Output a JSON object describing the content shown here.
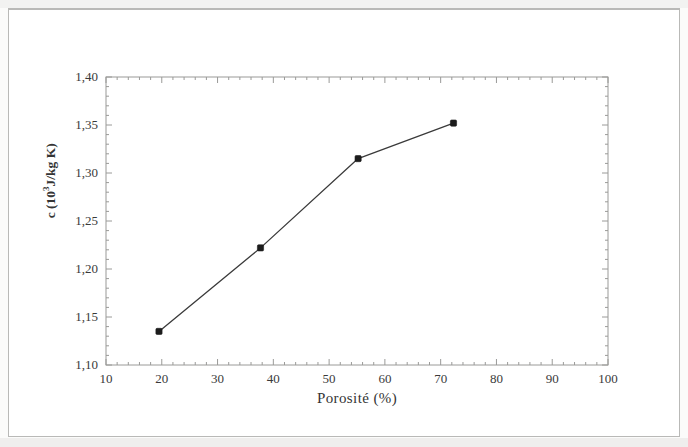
{
  "figure": {
    "background_color": "#ffffff",
    "page_border_color": "#b9b9b7",
    "ink_color": "#2b2b2b",
    "text_color": "#353535"
  },
  "axes": {
    "x_title": "Porosité (%)",
    "y_title_prefix": "c (10",
    "y_title_exponent": "3",
    "y_title_suffix": "J/kg K)",
    "y_title_plain": "c (10³ J/kg K)",
    "x_tick_labels": [
      "10",
      "20",
      "30",
      "40",
      "50",
      "60",
      "70",
      "80",
      "90",
      "100"
    ],
    "y_tick_labels": [
      "1,10",
      "1,15",
      "1,20",
      "1,25",
      "1,30",
      "1,35",
      "1,40"
    ]
  },
  "chart_data": {
    "type": "line",
    "title": "",
    "subtitle": "",
    "xlabel": "Porosité (%)",
    "ylabel": "c (10³ J/kg K)",
    "xlim": [
      10,
      100
    ],
    "ylim": [
      1.1,
      1.4
    ],
    "x_major_tick_step": 10,
    "x_minor_tick_step": 2,
    "y_major_tick_step": 0.05,
    "y_minor_tick_step": 0.01,
    "grid": false,
    "legend": null,
    "legend_position": "none",
    "decimal_separator": ",",
    "series": [
      {
        "name": "c",
        "marker": "filled-square",
        "marker_color": "#1c1c1c",
        "line_color": "#3a3a3a",
        "x": [
          19.5,
          37.7,
          55.2,
          72.3
        ],
        "y": [
          1.135,
          1.222,
          1.315,
          1.352
        ]
      }
    ],
    "annotations": []
  }
}
